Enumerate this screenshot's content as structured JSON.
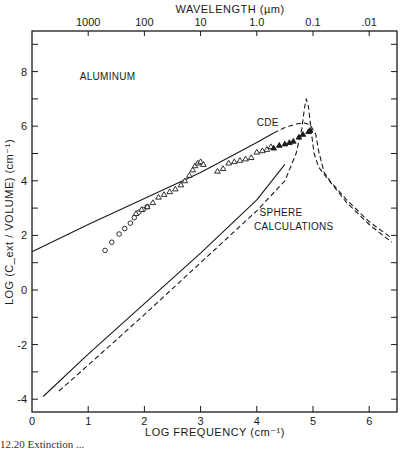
{
  "chart_data": {
    "type": "line",
    "title": "",
    "xlabel": "LOG  FREQUENCY  (cm⁻¹)",
    "ylabel": "LOG (C_ext / VOLUME)  (cm⁻¹)",
    "top_axis_label": "WAVELENGTH  (µm)",
    "xlim": [
      0,
      6.5
    ],
    "ylim": [
      -4.45,
      9.5
    ],
    "x_ticks": [
      0,
      1,
      2,
      3,
      4,
      5,
      6
    ],
    "x_tick_labels": [
      "0",
      "1",
      "2",
      "3",
      "4",
      "5",
      "6"
    ],
    "y_ticks": [
      -4,
      -3,
      -2,
      -1,
      0,
      1,
      2,
      3,
      4,
      5,
      6,
      7,
      8,
      9
    ],
    "y_tick_labels": {
      "-4": "-4",
      "-2": "-2",
      "0": "0",
      "2": "2",
      "4": "4",
      "6": "6",
      "8": "8"
    },
    "top_ticks": [
      {
        "label": "1000",
        "logf": 1
      },
      {
        "label": "100",
        "logf": 2
      },
      {
        "label": "10",
        "logf": 3
      },
      {
        "label": "1.0",
        "logf": 4
      },
      {
        "label": "0.1",
        "logf": 5
      },
      {
        "label": ".01",
        "logf": 6
      }
    ],
    "grid": false,
    "annotations": [
      {
        "text": "ALUMINUM",
        "x": 0.85,
        "y": 7.7
      },
      {
        "text": "CDE",
        "x": 4.0,
        "y": 6.0
      },
      {
        "text": "SPHERE",
        "x": 4.05,
        "y": 2.7
      },
      {
        "text": "CALCULATIONS",
        "x": 3.95,
        "y": 2.2
      }
    ],
    "series": [
      {
        "name": "CDE (solid)",
        "style": "solid",
        "x": [
          0.0,
          1.0,
          2.0,
          3.0,
          3.5,
          4.0,
          4.3
        ],
        "y": [
          1.4,
          2.4,
          3.35,
          4.3,
          4.85,
          5.4,
          5.75
        ]
      },
      {
        "name": "CDE (dashed continuation)",
        "style": "dashed",
        "x": [
          4.3,
          4.5,
          4.7,
          4.85,
          4.95,
          5.05,
          5.1,
          5.2,
          5.3,
          5.6,
          6.0,
          6.4
        ],
        "y": [
          5.75,
          5.95,
          6.08,
          6.12,
          6.05,
          5.7,
          5.1,
          4.3,
          4.0,
          3.3,
          2.5,
          1.9
        ]
      },
      {
        "name": "Sphere calculations (solid)",
        "style": "solid",
        "x": [
          0.2,
          1.0,
          2.0,
          3.0,
          4.0,
          4.5
        ],
        "y": [
          -3.9,
          -2.35,
          -0.5,
          1.35,
          3.3,
          4.6
        ]
      },
      {
        "name": "Sphere calculations (dashed)",
        "style": "dashed",
        "x": [
          0.48,
          1.0,
          2.0,
          3.0,
          4.0,
          4.5,
          4.7,
          4.8,
          4.85,
          4.88,
          4.92,
          4.97,
          5.02,
          5.1,
          5.25,
          5.6,
          6.0,
          6.4
        ],
        "y": [
          -3.7,
          -2.75,
          -0.9,
          1.0,
          2.9,
          4.0,
          5.0,
          5.9,
          6.7,
          7.0,
          6.7,
          5.8,
          5.0,
          4.5,
          4.1,
          3.2,
          2.4,
          1.75
        ]
      },
      {
        "name": "Measured (open circles)",
        "marker": "circle-open",
        "x": [
          1.3,
          1.42,
          1.55,
          1.65,
          1.75,
          1.82,
          1.9,
          1.98,
          2.05
        ],
        "y": [
          1.45,
          1.75,
          2.05,
          2.25,
          2.45,
          2.65,
          2.85,
          2.95,
          3.05
        ]
      },
      {
        "name": "Measured (open triangles)",
        "marker": "triangle-open",
        "x": [
          1.85,
          1.95,
          2.05,
          2.15,
          2.25,
          2.35,
          2.45,
          2.55,
          2.65,
          2.72,
          2.8,
          2.86,
          2.9,
          2.95,
          3.0,
          3.05,
          3.3,
          3.4,
          3.5,
          3.6,
          3.7,
          3.8,
          3.9,
          4.0,
          4.1,
          4.18,
          4.25
        ],
        "y": [
          2.8,
          2.95,
          3.05,
          3.2,
          3.4,
          3.5,
          3.6,
          3.7,
          3.85,
          4.0,
          4.2,
          4.4,
          4.55,
          4.65,
          4.7,
          4.6,
          4.35,
          4.45,
          4.65,
          4.7,
          4.75,
          4.8,
          4.85,
          5.05,
          5.1,
          5.15,
          5.25
        ]
      },
      {
        "name": "Measured (filled triangles)",
        "marker": "triangle-filled",
        "x": [
          4.3,
          4.4,
          4.5,
          4.58,
          4.65,
          4.75,
          4.82,
          4.92,
          4.95
        ],
        "y": [
          5.2,
          5.3,
          5.35,
          5.4,
          5.45,
          5.6,
          5.7,
          5.8,
          5.85
        ]
      }
    ],
    "legend": null
  },
  "caption": {
    "text": "12.20   Extinction ..."
  }
}
